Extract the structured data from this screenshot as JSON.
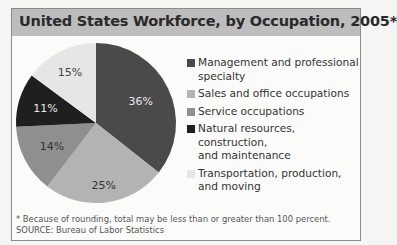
{
  "title": "United States Workforce, by Occupation, 2005*",
  "footnote": "* Because of rounding, total may be less than or greater than 100 percent.",
  "source": "SOURCE: Bureau of Labor Statistics",
  "legend": [
    {
      "label_line1": "Management and professional",
      "label_line2": "specialty",
      "color": "#4a4a4a"
    },
    {
      "label_line1": "Sales and office occupations",
      "label_line2": "",
      "color": "#b3b3b3"
    },
    {
      "label_line1": "Service occupations",
      "label_line2": "",
      "color": "#8f8f8f"
    },
    {
      "label_line1": "Natural resources, construction,",
      "label_line2": "and maintenance",
      "color": "#1f1f1f"
    },
    {
      "label_line1": "Transportation, production,",
      "label_line2": "and moving",
      "color": "#e6e6e6"
    }
  ],
  "slice_labels": [
    "36%",
    "25%",
    "14%",
    "11%",
    "15%"
  ],
  "chart_data": {
    "type": "pie",
    "title": "United States Workforce, by Occupation, 2005*",
    "categories": [
      "Management and professional specialty",
      "Sales and office occupations",
      "Service occupations",
      "Natural resources, construction, and maintenance",
      "Transportation, production, and moving"
    ],
    "values": [
      36,
      25,
      14,
      11,
      15
    ],
    "unit": "percent",
    "colors": [
      "#4a4a4a",
      "#b3b3b3",
      "#8f8f8f",
      "#1f1f1f",
      "#e6e6e6"
    ],
    "legend_position": "right",
    "start_angle": "12 o'clock, clockwise",
    "footnote": "* Because of rounding, total may be less than or greater than 100 percent.",
    "source": "SOURCE: Bureau of Labor Statistics"
  }
}
